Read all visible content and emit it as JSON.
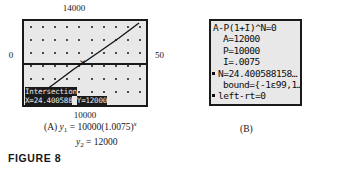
{
  "figure": {
    "label": "FIGURE 8"
  },
  "panel_a": {
    "tag": "(A)",
    "axis_labels": {
      "top": "14000",
      "bottom": "10000",
      "left": "0",
      "right": "50"
    },
    "screen_readout": {
      "title": "Intersection",
      "x_value": "X=24.400588",
      "y_value": "Y=12000"
    },
    "cursor_glyph": "×",
    "caption_line1_prefix": "(A) ",
    "caption_line1_fn": "y",
    "caption_line1_sub": "1",
    "caption_line1_eq": " = 10000(1.0075)",
    "caption_line1_exp": "x",
    "caption_line2_fn": "y",
    "caption_line2_sub": "2",
    "caption_line2_eq": " = 12000"
  },
  "panel_b": {
    "tag": "(B)",
    "lines": [
      "A-P(1+I)^N=0",
      "A=12000",
      "P=10000",
      "I=.0075",
      "N=24.400588158…",
      "bound={-1ε99,1…",
      "left-rt=0"
    ]
  },
  "chart_data": {
    "type": "line",
    "title": "",
    "xlabel": "",
    "ylabel": "",
    "xlim": [
      0,
      50
    ],
    "ylim": [
      10000,
      14000
    ],
    "grid": true,
    "legend": "none",
    "series": [
      {
        "name": "y1 = 10000(1.0075)^x",
        "x": [
          0,
          10,
          20,
          24.400588,
          30,
          40,
          50
        ],
        "y": [
          10000,
          10776,
          11614,
          12000,
          12513,
          13483,
          14528
        ]
      },
      {
        "name": "y2 = 12000",
        "x": [
          0,
          50
        ],
        "y": [
          12000,
          12000
        ]
      }
    ],
    "annotations": [
      {
        "label": "Intersection",
        "x": 24.400588,
        "y": 12000
      }
    ]
  }
}
